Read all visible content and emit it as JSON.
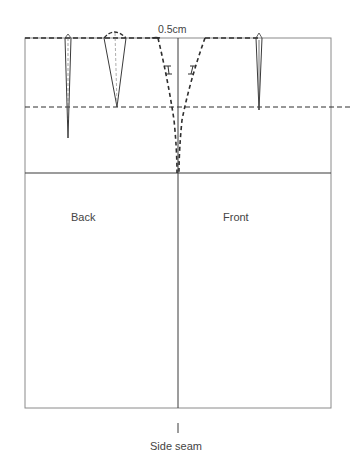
{
  "diagram": {
    "type": "skirt-pattern-block",
    "labels": {
      "measurement": "0.5cm",
      "back": "Back",
      "front": "Front",
      "side_seam": "Side seam"
    },
    "colors": {
      "line": "#3a3a3a",
      "outline": "#8a8a8a",
      "background": "#ffffff"
    },
    "elements": [
      {
        "name": "waistline",
        "style": "dashed"
      },
      {
        "name": "dart-depth-line",
        "style": "dashed"
      },
      {
        "name": "hipline",
        "style": "solid"
      },
      {
        "name": "side-seam-line",
        "style": "solid"
      },
      {
        "name": "back-dart-1",
        "style": "solid"
      },
      {
        "name": "back-dart-2",
        "style": "solid"
      },
      {
        "name": "front-dart",
        "style": "solid"
      },
      {
        "name": "side-seam-shaping-back",
        "style": "dashed",
        "notch": "I"
      },
      {
        "name": "side-seam-shaping-front",
        "style": "dashed",
        "notch": "I"
      }
    ]
  }
}
